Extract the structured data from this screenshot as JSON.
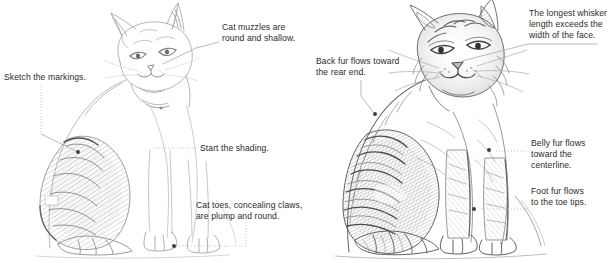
{
  "figure": {
    "background_color": "#ffffff",
    "text_color": "#2b2b2b",
    "leader_color": "#9a9a9a",
    "dot_color": "#3a3a3a",
    "pencil_color": "#8e8e93"
  },
  "panels": [
    {
      "id": "left",
      "name": "left-sketch-panel",
      "subject": "seated cat, light line sketch with partial shading on haunch",
      "annotations": [
        {
          "id": "cat-muzzles",
          "text": "Cat muzzles are\nround and shallow.",
          "x": 222,
          "y": 22,
          "anchor_x": 163,
          "anchor_y": 64,
          "leader": "diagonal"
        },
        {
          "id": "sketch-markings",
          "text": "Sketch the markings.",
          "x": 4,
          "y": 72,
          "anchor_x": 78,
          "anchor_y": 152,
          "leader": "dotted-vertical-then-diagonal"
        },
        {
          "id": "start-shading",
          "text": "Start the shading.",
          "x": 200,
          "y": 144,
          "anchor_x": 150,
          "anchor_y": 147,
          "leader": "dotted-horizontal"
        },
        {
          "id": "cat-toes",
          "text": "Cat toes, concealing claws,\nare plump and round.",
          "x": 196,
          "y": 200,
          "anchor_x": 172,
          "anchor_y": 246,
          "leader": "dotted-down-then-horizontal"
        }
      ]
    },
    {
      "id": "right",
      "name": "right-sketch-panel",
      "subject": "seated cat, fully rendered pencil shading with fur texture",
      "annotations": [
        {
          "id": "longest-whisker",
          "text": "The longest whisker\nlength exceeds the\nwidth of the face.",
          "x": 529,
          "y": 8,
          "anchor_x": 462,
          "anchor_y": 60,
          "leader": "diagonal"
        },
        {
          "id": "back-fur",
          "text": "Back fur flows toward\nthe rear end.",
          "x": 316,
          "y": 56,
          "anchor_x": 374,
          "anchor_y": 113,
          "leader": "vertical-then-diagonal"
        },
        {
          "id": "belly-fur",
          "text": "Belly fur flows\ntoward the\ncenterline.",
          "x": 531,
          "y": 138,
          "anchor_x": 490,
          "anchor_y": 151,
          "leader": "dotted-horizontal"
        },
        {
          "id": "foot-fur",
          "text": "Foot fur flows\nto the toe tips.",
          "x": 531,
          "y": 186,
          "anchor_x": 474,
          "anchor_y": 209,
          "leader": "dotted-horizontal"
        }
      ]
    }
  ]
}
